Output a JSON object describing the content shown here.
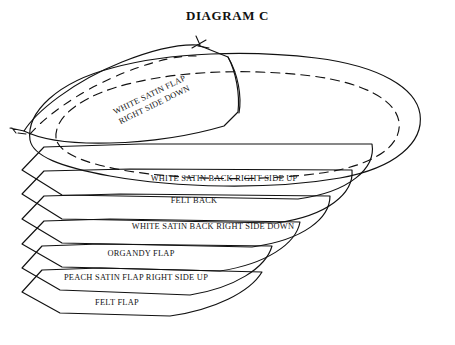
{
  "document": {
    "title": "DIAGRAM C",
    "background_color": "#ffffff",
    "ink_color": "#111111"
  },
  "diagram": {
    "type": "layered-assembly-cutaway",
    "layers": [
      {
        "id": "white-satin-flap",
        "label": "WHITE SATIN FLAP\nRIGHT SIDE DOWN",
        "label_line_1": "WHITE SATIN FLAP",
        "label_line_2": "RIGHT SIDE DOWN",
        "rotation_deg": -26,
        "label_x": 152,
        "label_y": 100,
        "has_dashed_stitching": true
      },
      {
        "id": "white-satin-back-right-side-up",
        "label": "WHITE SATIN BACK RIGHT SIDE UP",
        "rotation_deg": 0,
        "label_x": 224,
        "label_y": 178,
        "has_dashed_stitching": true
      },
      {
        "id": "felt-back",
        "label": "FELT BACK",
        "rotation_deg": 0,
        "label_x": 194,
        "label_y": 200,
        "has_dashed_stitching": false
      },
      {
        "id": "white-satin-back-right-side-down",
        "label": "WHITE SATIN BACK RIGHT SIDE DOWN",
        "rotation_deg": 0,
        "label_x": 213,
        "label_y": 226,
        "has_dashed_stitching": false
      },
      {
        "id": "organdy-flap",
        "label": "ORGANDY FLAP",
        "rotation_deg": 0,
        "label_x": 141,
        "label_y": 253,
        "has_dashed_stitching": false
      },
      {
        "id": "peach-satin-flap-right-side-up",
        "label": "PEACH SATIN FLAP RIGHT SIDE UP",
        "rotation_deg": 0,
        "label_x": 136,
        "label_y": 277,
        "has_dashed_stitching": false
      },
      {
        "id": "felt-flap",
        "label": "FELT FLAP",
        "rotation_deg": 0,
        "label_x": 117,
        "label_y": 302,
        "has_dashed_stitching": false
      }
    ]
  }
}
